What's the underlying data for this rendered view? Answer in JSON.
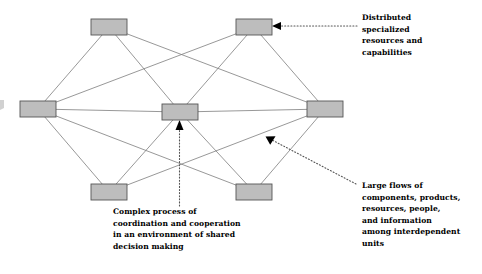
{
  "diagram": {
    "node_fill": "#bdbdbd",
    "node_stroke": "#555555",
    "edge_color": "#7d7d7d",
    "annotation_color": "#555555",
    "nodes": [
      {
        "id": "top-left",
        "label": "",
        "x": 91,
        "y": 19,
        "w": 36,
        "h": 16
      },
      {
        "id": "top-right",
        "label": "",
        "x": 236,
        "y": 19,
        "w": 36,
        "h": 16
      },
      {
        "id": "middle-left",
        "label": "",
        "x": 20,
        "y": 101,
        "w": 36,
        "h": 16
      },
      {
        "id": "middle-center",
        "label": "",
        "x": 162,
        "y": 104,
        "w": 36,
        "h": 16
      },
      {
        "id": "middle-right",
        "label": "",
        "x": 307,
        "y": 101,
        "w": 36,
        "h": 16
      },
      {
        "id": "bottom-left",
        "label": "",
        "x": 91,
        "y": 184,
        "w": 36,
        "h": 16
      },
      {
        "id": "bottom-right",
        "label": "",
        "x": 236,
        "y": 184,
        "w": 36,
        "h": 16
      }
    ],
    "edges": [
      {
        "from": "top-left",
        "to": "middle-left"
      },
      {
        "from": "top-left",
        "to": "middle-center"
      },
      {
        "from": "top-left",
        "to": "middle-right"
      },
      {
        "from": "top-right",
        "to": "middle-left"
      },
      {
        "from": "top-right",
        "to": "middle-center"
      },
      {
        "from": "top-right",
        "to": "middle-right"
      },
      {
        "from": "middle-left",
        "to": "middle-center"
      },
      {
        "from": "middle-center",
        "to": "middle-right"
      },
      {
        "from": "middle-left",
        "to": "bottom-left"
      },
      {
        "from": "middle-left",
        "to": "bottom-right"
      },
      {
        "from": "middle-center",
        "to": "bottom-left"
      },
      {
        "from": "middle-center",
        "to": "bottom-right"
      },
      {
        "from": "middle-right",
        "to": "bottom-left"
      },
      {
        "from": "middle-right",
        "to": "bottom-right"
      }
    ]
  },
  "annotations": {
    "top_right": {
      "id": "distributed-resources-note",
      "target_node": "top-right",
      "lines": [
        "Distributed",
        "specialized",
        "resources and",
        "capabilities"
      ],
      "text": "Distributed specialized resources and capabilities"
    },
    "bottom_right": {
      "id": "large-flows-note",
      "target": "edge-middle-right-to-bottom-left",
      "lines": [
        "Large flows of",
        "components, products,",
        "resources, people,",
        "and information",
        "among interdependent",
        "units"
      ],
      "text": "Large flows of components, products, resources, people, and information among interdependent units"
    },
    "bottom_center": {
      "id": "complex-process-note",
      "target_node": "middle-center",
      "lines": [
        "Complex process of",
        "coordination and cooperation",
        "in an environment of shared",
        "decision making"
      ],
      "text": "Complex process of coordination and cooperation in an environment of shared decision making"
    }
  }
}
